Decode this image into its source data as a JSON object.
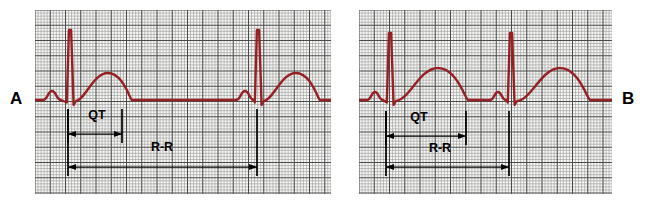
{
  "figure": {
    "background_color": "#ffffff",
    "width": 651,
    "height": 205
  },
  "panels": [
    {
      "id": "A",
      "label": "A",
      "label_position": "left",
      "grid": {
        "x": 35,
        "y": 10,
        "width": 296,
        "height": 184,
        "small_cell_px": 3.05,
        "major_every": 5,
        "minor_color": "#9a9a9a",
        "major_color": "#4a4a4a",
        "background": "#f7f7f5"
      },
      "trace": {
        "color": "#962024",
        "stroke_width": 2.4,
        "baseline_y": 100,
        "beats": [
          {
            "p_peak_x": 52,
            "qrs_peak_x": 70,
            "qrs_peak_y": 30,
            "t_peak_x": 108
          },
          {
            "p_peak_x": 245,
            "qrs_peak_x": 258,
            "qrs_peak_y": 30,
            "t_peak_x": 296
          }
        ]
      },
      "annotations": [
        {
          "name": "qt-interval",
          "label": "QT",
          "label_x": 97,
          "label_y": 119,
          "arrow_y": 134,
          "start_x": 68,
          "end_x": 122,
          "tick_top": 109,
          "tick_bottom": 143
        },
        {
          "name": "rr-interval",
          "label": "R-R",
          "label_x": 162,
          "label_y": 151,
          "arrow_y": 167,
          "start_x": 68,
          "end_x": 257,
          "tick_top": 109,
          "tick_bottom": 176
        }
      ]
    },
    {
      "id": "B",
      "label": "B",
      "label_position": "right",
      "grid": {
        "x": 359,
        "y": 10,
        "width": 253,
        "height": 184,
        "small_cell_px": 3.05,
        "major_every": 5,
        "minor_color": "#9a9a9a",
        "major_color": "#4a4a4a",
        "background": "#f7f7f5"
      },
      "trace": {
        "color": "#962024",
        "stroke_width": 2.4,
        "baseline_y": 100,
        "beats": [
          {
            "p_peak_x": 375,
            "qrs_peak_x": 390,
            "qrs_peak_y": 33,
            "t_peak_x": 438
          },
          {
            "p_peak_x": 498,
            "qrs_peak_x": 511,
            "qrs_peak_y": 33,
            "t_peak_x": 560
          }
        ]
      },
      "annotations": [
        {
          "name": "qt-interval",
          "label": "QT",
          "label_x": 419,
          "label_y": 121,
          "arrow_y": 136,
          "start_x": 386,
          "end_x": 466,
          "tick_top": 111,
          "tick_bottom": 145
        },
        {
          "name": "rr-interval",
          "label": "R-R",
          "label_x": 440,
          "label_y": 152,
          "arrow_y": 167,
          "start_x": 386,
          "end_x": 509,
          "tick_top": 111,
          "tick_bottom": 176
        }
      ]
    }
  ],
  "chart_data": {
    "type": "line",
    "xlabel": "",
    "ylabel": "",
    "legend": [],
    "grid": true,
    "series": [
      {
        "name": "Panel A - ECG trace (normal QT)",
        "panel": "A",
        "color": "#962024",
        "annotations": [
          "QT",
          "R-R"
        ],
        "interval_px": {
          "QT": 54,
          "R-R": 189
        },
        "features": [
          {
            "wave": "P",
            "x": 52,
            "amplitude_px": 9
          },
          {
            "wave": "QRS",
            "x": 70,
            "amplitude_px": 70
          },
          {
            "wave": "T",
            "x": 108,
            "amplitude_px": 28
          },
          {
            "wave": "P",
            "x": 245,
            "amplitude_px": 9
          },
          {
            "wave": "QRS",
            "x": 258,
            "amplitude_px": 70
          },
          {
            "wave": "T",
            "x": 296,
            "amplitude_px": 28
          }
        ]
      },
      {
        "name": "Panel B - ECG trace (prolonged QT)",
        "panel": "B",
        "color": "#962024",
        "annotations": [
          "QT",
          "R-R"
        ],
        "interval_px": {
          "QT": 80,
          "R-R": 123
        },
        "features": [
          {
            "wave": "P",
            "x": 375,
            "amplitude_px": 8
          },
          {
            "wave": "QRS",
            "x": 390,
            "amplitude_px": 67
          },
          {
            "wave": "T",
            "x": 438,
            "amplitude_px": 33
          },
          {
            "wave": "P",
            "x": 498,
            "amplitude_px": 8
          },
          {
            "wave": "QRS",
            "x": 511,
            "amplitude_px": 67
          },
          {
            "wave": "T",
            "x": 560,
            "amplitude_px": 33
          }
        ]
      }
    ]
  },
  "labels": {
    "panel_a": "A",
    "panel_b": "B",
    "qt": "QT",
    "rr": "R-R"
  }
}
